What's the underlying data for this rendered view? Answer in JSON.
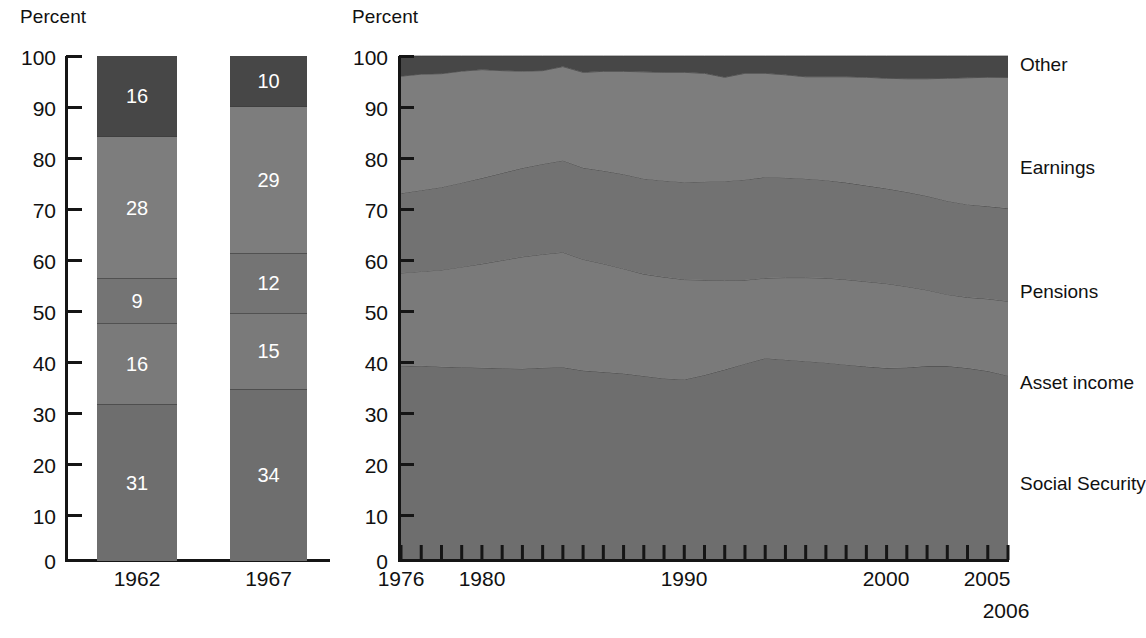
{
  "left_panel": {
    "axis_label": "Percent",
    "y_ticks": [
      "100",
      "90",
      "80",
      "70",
      "60",
      "50",
      "40",
      "30",
      "20",
      "10",
      "0"
    ],
    "x_ticks": [
      "1962",
      "1967"
    ]
  },
  "right_panel": {
    "axis_label": "Percent",
    "y_ticks": [
      "100",
      "90",
      "80",
      "70",
      "60",
      "50",
      "40",
      "30",
      "20",
      "10",
      "0"
    ],
    "x_ticks": [
      "1976",
      "1980",
      "1990",
      "2000",
      "2005"
    ],
    "x_tick_extra": "2006",
    "legend": [
      "Other",
      "Earnings",
      "Pensions",
      "Asset income",
      "Social Security"
    ]
  },
  "colors": {
    "social_security": "#6e6e6e",
    "asset_income": "#7a7a7a",
    "pensions": "#727272",
    "earnings": "#7d7d7d",
    "other": "#474747",
    "axis": "#151515",
    "value_text": "#ffffff",
    "background": "#ffffff"
  },
  "chart_data": [
    {
      "type": "bar",
      "title": "Shares of aggregate income, 1962 and 1967",
      "subtitle": "",
      "xlabel": "",
      "ylabel": "Percent",
      "ylim": [
        0,
        100
      ],
      "grid": false,
      "legend_position": "none",
      "stacked": true,
      "categories": [
        "1962",
        "1967"
      ],
      "series": [
        {
          "name": "Social Security",
          "values": [
            31,
            34
          ]
        },
        {
          "name": "Asset income",
          "values": [
            16,
            15
          ]
        },
        {
          "name": "Pensions",
          "values": [
            9,
            12
          ]
        },
        {
          "name": "Earnings",
          "values": [
            28,
            29
          ]
        },
        {
          "name": "Other",
          "values": [
            16,
            10
          ]
        }
      ],
      "data_labels": {
        "1962": [
          "31",
          "16",
          "9",
          "28",
          "16"
        ],
        "1967": [
          "34",
          "15",
          "12",
          "29",
          "10"
        ]
      }
    },
    {
      "type": "area",
      "title": "Shares of aggregate income, 1976-2006",
      "subtitle": "",
      "xlabel": "",
      "ylabel": "Percent",
      "ylim": [
        0,
        100
      ],
      "xlim": [
        1976,
        2006
      ],
      "grid": false,
      "stacked": true,
      "legend_position": "right",
      "x": [
        1976,
        1977,
        1978,
        1979,
        1980,
        1981,
        1982,
        1983,
        1984,
        1985,
        1986,
        1987,
        1988,
        1989,
        1990,
        1991,
        1992,
        1993,
        1994,
        1995,
        1996,
        1997,
        1998,
        1999,
        2000,
        2001,
        2002,
        2003,
        2004,
        2005,
        2006
      ],
      "series": [
        {
          "name": "Social Security",
          "values": [
            38.5,
            38.6,
            38.4,
            38.3,
            38.2,
            38.1,
            38.0,
            38.2,
            38.3,
            38.4,
            38.1,
            37.8,
            37.3,
            36.8,
            36.6,
            37.5,
            38.6,
            39.8,
            40.9,
            40.6,
            40.3,
            40.0,
            39.6,
            39.2,
            38.9,
            39.0,
            39.3,
            39.3,
            38.9,
            38.3,
            37.0
          ]
        },
        {
          "name": "Asset income",
          "values": [
            18.5,
            18.7,
            19.2,
            19.9,
            20.6,
            21.4,
            22.2,
            22.5,
            22.8,
            22.5,
            21.9,
            21.2,
            20.6,
            20.5,
            20.2,
            19.2,
            18.0,
            16.9,
            16.2,
            16.6,
            16.9,
            17.1,
            17.2,
            17.2,
            17.1,
            16.4,
            15.4,
            14.5,
            14.3,
            14.6,
            14.9
          ]
        },
        {
          "name": "Pensions",
          "values": [
            15.8,
            16.1,
            16.4,
            16.7,
            17.0,
            17.3,
            17.6,
            17.9,
            18.2,
            18.5,
            18.8,
            19.1,
            19.3,
            19.5,
            19.7,
            19.9,
            20.1,
            20.3,
            20.4,
            20.2,
            20.0,
            19.8,
            19.6,
            19.4,
            19.2,
            19.1,
            19.0,
            18.9,
            18.8,
            18.7,
            18.6
          ]
        },
        {
          "name": "Earnings",
          "values": [
            23.2,
            23.0,
            22.5,
            22.1,
            21.5,
            20.3,
            19.2,
            18.5,
            18.6,
            19.3,
            20.1,
            20.8,
            21.6,
            21.9,
            22.2,
            21.9,
            21.0,
            21.5,
            21.0,
            20.8,
            20.6,
            20.9,
            21.4,
            21.9,
            22.3,
            22.9,
            23.7,
            24.8,
            25.6,
            26.1,
            26.2
          ]
        },
        {
          "name": "Other",
          "values": [
            4.0,
            3.6,
            3.5,
            3.0,
            2.7,
            2.9,
            3.0,
            2.9,
            2.1,
            3.3,
            3.1,
            3.1,
            3.2,
            3.3,
            3.3,
            3.5,
            4.3,
            3.5,
            3.5,
            3.8,
            4.2,
            4.2,
            4.2,
            4.3,
            4.5,
            4.6,
            4.6,
            4.5,
            4.4,
            4.3,
            4.3
          ]
        }
      ]
    }
  ]
}
